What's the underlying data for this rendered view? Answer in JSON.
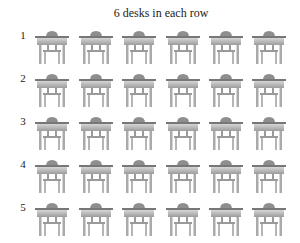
{
  "title": "6 desks in each row",
  "rows": [
    {
      "label": "1",
      "desks": 6
    },
    {
      "label": "2",
      "desks": 6
    },
    {
      "label": "3",
      "desks": 6
    },
    {
      "label": "4",
      "desks": 6
    },
    {
      "label": "5",
      "desks": 6
    }
  ],
  "desk_icon": "desk-with-chair-icon",
  "colors": {
    "seat": "#8a8a8a",
    "top": "#b8b8b8",
    "legs": "#a8a8a8"
  }
}
